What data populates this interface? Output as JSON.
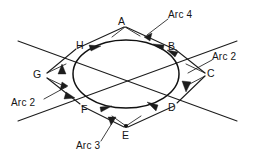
{
  "figure": {
    "canvas": {
      "width": 253,
      "height": 163
    },
    "stroke_color": "#1c1c1c",
    "background_color": "#ffffff"
  },
  "points": [
    {
      "id": "A",
      "label": "A",
      "x": 122,
      "y": 22,
      "role": "outer-vertex-top"
    },
    {
      "id": "B",
      "label": "B",
      "x": 172,
      "y": 47,
      "role": "ellipse-point-upper-right"
    },
    {
      "id": "C",
      "label": "C",
      "x": 211,
      "y": 74,
      "role": "outer-vertex-right"
    },
    {
      "id": "D",
      "label": "D",
      "x": 172,
      "y": 108,
      "role": "ellipse-point-lower-right"
    },
    {
      "id": "E",
      "label": "E",
      "x": 126,
      "y": 136,
      "role": "outer-vertex-bottom"
    },
    {
      "id": "F",
      "label": "F",
      "x": 85,
      "y": 110,
      "role": "ellipse-point-lower-left"
    },
    {
      "id": "G",
      "label": "G",
      "x": 38,
      "y": 75,
      "role": "outer-vertex-left"
    },
    {
      "id": "H",
      "label": "H",
      "x": 80,
      "y": 46,
      "role": "ellipse-point-upper-left"
    }
  ],
  "arc_callouts": [
    {
      "id": "arc4",
      "label": "Arc 4",
      "x": 172,
      "y": 15,
      "role": "callout-top-right"
    },
    {
      "id": "arc2_right",
      "label": "Arc 2",
      "x": 215,
      "y": 57,
      "role": "callout-right"
    },
    {
      "id": "arc2_left",
      "label": "Arc 2",
      "x": 14,
      "y": 103,
      "role": "callout-lower-left"
    },
    {
      "id": "arc3",
      "label": "Arc 3",
      "x": 80,
      "y": 146,
      "role": "callout-bottom"
    }
  ],
  "ellipse": {
    "center_x": 126,
    "center_y": 74,
    "radius_x": 53,
    "radius_y": 34
  }
}
